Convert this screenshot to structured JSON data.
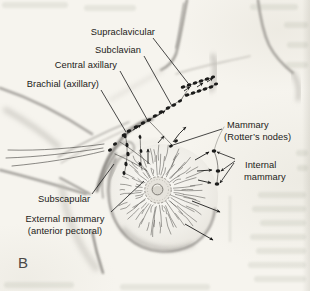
{
  "figure": {
    "panel_letter": "B"
  },
  "labels": {
    "supraclavicular": "Supraclavicular",
    "subclavian": "Subclavian",
    "central_axillary": "Central axillary",
    "brachial_axillary": "Brachial (axillary)",
    "mammary_rotters": [
      "Mammary",
      "(Rotter’s nodes)"
    ],
    "internal_mammary": [
      "Internal",
      "mammary"
    ],
    "subscapular": "Subscapular",
    "external_mammary": [
      "External mammary",
      "(anterior pectoral)"
    ]
  },
  "colors": {
    "ink": "#1b1b1a",
    "paper": "#f6f4ee",
    "lymphatic_line": "#4b4a45",
    "body_shading": "#a3a09a"
  }
}
